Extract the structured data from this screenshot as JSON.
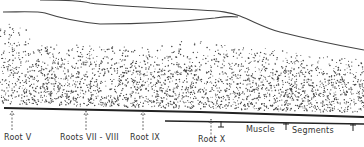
{
  "diagram": {
    "roots": [
      {
        "label": "Root V",
        "x": 12
      },
      {
        "label": "Roots VII - VIII",
        "x": 86
      },
      {
        "label": "Root IX",
        "x": 143
      },
      {
        "label": "Root X",
        "x": 211
      }
    ],
    "segments_label_1": "Muscle",
    "segments_label_2": "Segments",
    "line_color": "#333333"
  }
}
